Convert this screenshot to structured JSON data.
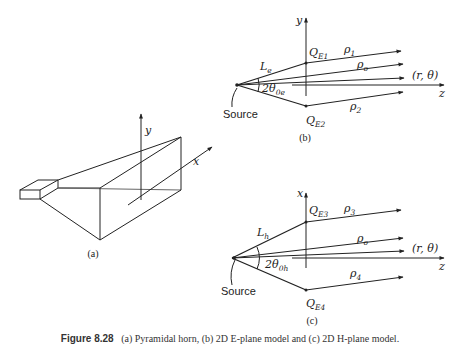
{
  "figure": {
    "panel_a": {
      "label": "(a)",
      "axes": {
        "y": "y",
        "x": "x"
      }
    },
    "panel_b": {
      "label": "(b)",
      "vertical_axis": "y",
      "horizontal_axis": "z",
      "source_label": "Source",
      "length_label": {
        "main": "L",
        "sub": "e"
      },
      "angle_label": {
        "main": "2θ",
        "sub": "0e"
      },
      "point_top": {
        "main": "Q",
        "sub": "E1"
      },
      "point_bottom": {
        "main": "Q",
        "sub": "E2"
      },
      "rays": [
        {
          "main": "ρ",
          "sub": "1"
        },
        {
          "main": "ρ",
          "sub": "o"
        },
        {
          "main": "ρ",
          "sub": "2"
        }
      ],
      "observation_point": "(r, θ)"
    },
    "panel_c": {
      "label": "(c)",
      "vertical_axis": "x",
      "horizontal_axis": "z",
      "source_label": "Source",
      "length_label": {
        "main": "L",
        "sub": "h"
      },
      "angle_label": {
        "main": "2θ",
        "sub": "0h"
      },
      "point_top": {
        "main": "Q",
        "sub": "E3"
      },
      "point_bottom": {
        "main": "Q",
        "sub": "E4"
      },
      "rays": [
        {
          "main": "ρ",
          "sub": "3"
        },
        {
          "main": "ρ",
          "sub": "o"
        },
        {
          "main": "ρ",
          "sub": "4"
        }
      ],
      "observation_point": "(r, θ)"
    },
    "caption": {
      "number": "Figure 8.28",
      "text": "(a) Pyramidal horn, (b) 2D E-plane model and (c) 2D H-plane model."
    },
    "colors": {
      "line": "#222222",
      "background": "#ffffff"
    }
  }
}
